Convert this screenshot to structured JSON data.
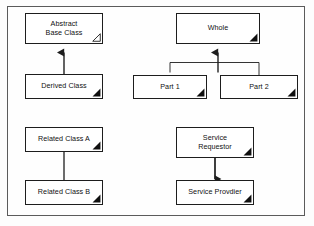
{
  "diagram": {
    "frame": {
      "border_color": "#5b5b5b",
      "background": "#fefefe"
    },
    "node_style": {
      "border_color": "#1d1d1d",
      "fill_color": "#ffffff",
      "text_color": "#111111"
    },
    "connector_color": "#2a2a2a",
    "nodes": [
      {
        "id": "abstract-base-class",
        "label": "Abstract\nBase Class",
        "x": 25,
        "y": 13,
        "width": 78,
        "height": 31,
        "marker": "hollow-triangle"
      },
      {
        "id": "derived-class",
        "label": "Derived Class",
        "x": 25,
        "y": 74,
        "width": 78,
        "height": 25,
        "marker": "filled-triangle"
      },
      {
        "id": "whole",
        "label": "Whole",
        "x": 176,
        "y": 13,
        "width": 84,
        "height": 31,
        "marker": "filled-triangle"
      },
      {
        "id": "part-1",
        "label": "Part 1",
        "x": 133,
        "y": 75,
        "width": 74,
        "height": 24,
        "marker": "filled-triangle"
      },
      {
        "id": "part-2",
        "label": "Part 2",
        "x": 220,
        "y": 75,
        "width": 78,
        "height": 24,
        "marker": "filled-triangle"
      },
      {
        "id": "related-class-a",
        "label": "Related Class A",
        "x": 25,
        "y": 127,
        "width": 78,
        "height": 25,
        "marker": "filled-triangle"
      },
      {
        "id": "related-class-b",
        "label": "Related Class B",
        "x": 25,
        "y": 180,
        "width": 78,
        "height": 25,
        "marker": "filled-triangle"
      },
      {
        "id": "service-requestor",
        "label": "Service\nRequestor",
        "x": 176,
        "y": 127,
        "width": 78,
        "height": 31,
        "marker": "filled-triangle"
      },
      {
        "id": "service-provider",
        "label": "Service Provdier",
        "x": 176,
        "y": 180,
        "width": 78,
        "height": 25,
        "marker": "filled-triangle"
      }
    ],
    "connectors": [
      {
        "id": "inheritance-derived-to-base",
        "from": "derived-class",
        "to": "abstract-base-class",
        "kind": "generalization",
        "arrowhead": "filled-triangle-up"
      },
      {
        "id": "aggregation-parts-to-whole",
        "from": "part-1,part-2",
        "to": "whole",
        "kind": "aggregation-fork",
        "arrowhead": "filled-triangle-up"
      },
      {
        "id": "association-a-to-b",
        "from": "related-class-a",
        "to": "related-class-b",
        "kind": "association",
        "arrowhead": "none"
      },
      {
        "id": "dependency-requestor-to-provider",
        "from": "service-requestor",
        "to": "service-provider",
        "kind": "dependency",
        "arrowhead": "filled-arrow-down"
      }
    ]
  }
}
